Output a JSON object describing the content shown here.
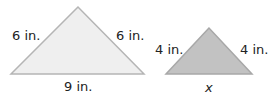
{
  "figures": [
    {
      "id": "large-triangle",
      "fill": "#efefef",
      "stroke": "#b5b5b5",
      "labels": {
        "left_side": "6 in.",
        "right_side": "6 in.",
        "base": "9 in."
      }
    },
    {
      "id": "small-triangle",
      "fill": "#c2c2c2",
      "stroke": "#a8a8a8",
      "labels": {
        "left_side": "4 in.",
        "right_side": "4 in.",
        "base": "x"
      }
    }
  ]
}
